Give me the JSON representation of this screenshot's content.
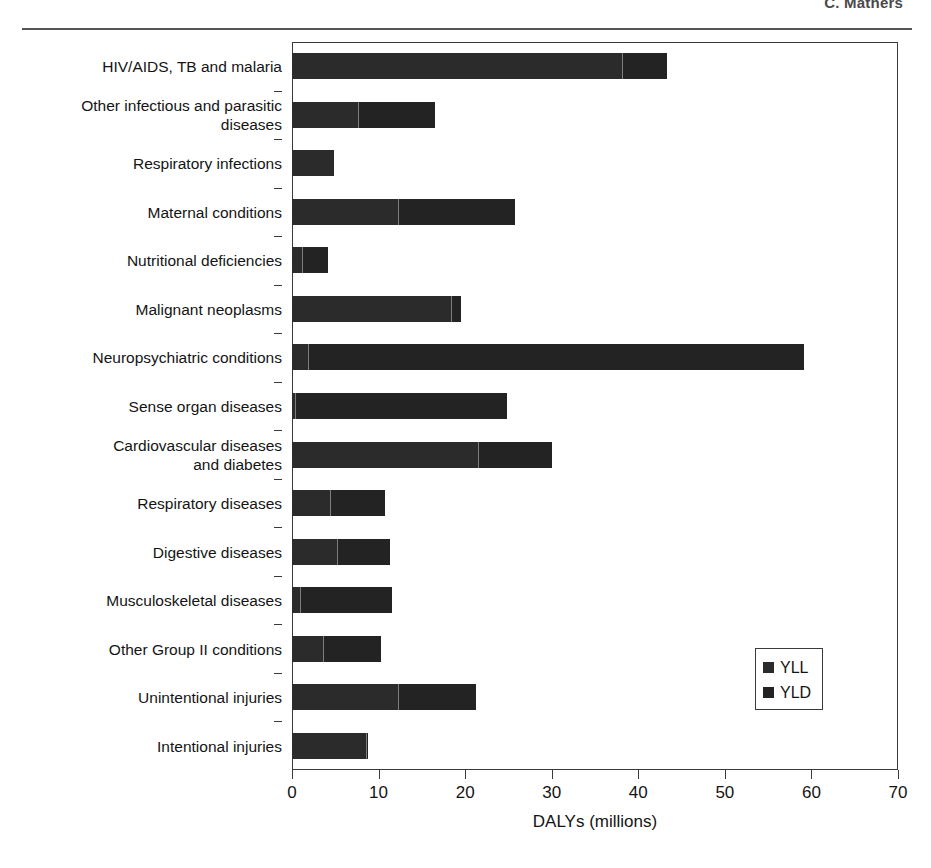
{
  "header": {
    "author": "C. Mathers"
  },
  "legend": {
    "position": "inside-bottom-right",
    "items": [
      {
        "label": "YLL",
        "color": "#2b2b2b",
        "icon": "square-swatch-icon"
      },
      {
        "label": "YLD",
        "color": "#232323",
        "icon": "square-swatch-icon"
      }
    ]
  },
  "chart_data": {
    "type": "bar",
    "orientation": "horizontal",
    "stacked": true,
    "title": "",
    "subtitle": "",
    "xlabel": "DALYs (millions)",
    "ylabel": "",
    "xlim": [
      0,
      70
    ],
    "xticks": [
      0,
      10,
      20,
      30,
      40,
      50,
      60,
      70
    ],
    "xticklabels": [
      "0",
      "10",
      "20",
      "30",
      "40",
      "50",
      "60",
      "70"
    ],
    "grid": false,
    "legend_position": "inside-bottom-right",
    "categories": [
      "HIV/AIDS, TB and malaria",
      "Other infectious and parasitic\ndiseases",
      "Respiratory infections",
      "Maternal conditions",
      "Nutritional deficiencies",
      "Malignant neoplasms",
      "Neuropsychiatric conditions",
      "Sense organ diseases",
      "Cardiovascular diseases\nand diabetes",
      "Respiratory diseases",
      "Digestive diseases",
      "Musculoskeletal diseases",
      "Other Group II conditions",
      "Unintentional injuries",
      "Intentional injuries"
    ],
    "series": [
      {
        "name": "YLL",
        "color": "#2b2b2b",
        "values": [
          38.1,
          7.6,
          4.8,
          12.2,
          1.2,
          18.4,
          1.9,
          0.4,
          21.5,
          4.4,
          5.2,
          0.9,
          3.6,
          12.2,
          8.6
        ]
      },
      {
        "name": "YLD",
        "color": "#232323",
        "values": [
          5.2,
          8.9,
          0.0,
          13.6,
          3.0,
          1.1,
          57.3,
          24.4,
          8.5,
          6.4,
          6.1,
          10.6,
          6.7,
          9.1,
          0.2
        ]
      }
    ],
    "totals": [
      43.3,
      16.5,
      4.8,
      25.8,
      4.2,
      19.5,
      59.2,
      24.8,
      30.0,
      10.8,
      11.3,
      11.5,
      10.3,
      21.3,
      8.8
    ]
  }
}
